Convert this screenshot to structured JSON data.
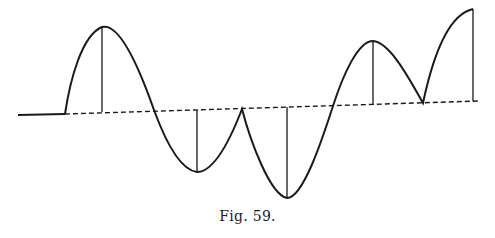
{
  "figure": {
    "caption": "Fig. 59.",
    "stroke_color": "#1a1a1a",
    "background": "#ffffff"
  },
  "diagram": {
    "type": "wave-curve",
    "baseline_solid": {
      "x1": 18,
      "y1": 115,
      "x2": 65,
      "y2": 114
    },
    "axis_dashed": {
      "x1": 65,
      "y1": 114,
      "x2": 480,
      "y2": 101
    },
    "curve_path": "M65,114 C70,80 82,35 102,27 C120,22 140,70 154,110 C165,140 180,170 197,172 C215,172 232,135 242,109 C250,140 270,195 287,198 C303,198 322,140 333,106 C343,75 358,41 373,41 C390,42 410,80 423,103 C430,70 445,15 473,9",
    "ordinates": [
      {
        "x": 102,
        "y_top": 27,
        "y_axis": 112
      },
      {
        "x": 197,
        "y_top": 172,
        "y_axis": 110
      },
      {
        "x": 287,
        "y_top": 198,
        "y_axis": 107
      },
      {
        "x": 373,
        "y_top": 41,
        "y_axis": 105
      },
      {
        "x": 473,
        "y_top": 9,
        "y_axis": 101
      }
    ]
  }
}
